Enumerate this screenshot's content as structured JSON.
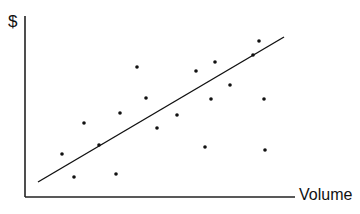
{
  "chart_data": {
    "type": "scatter",
    "title": "",
    "xlabel": "Volume",
    "ylabel": "$",
    "grid": false,
    "legend": null,
    "ticks": {
      "x": [],
      "y": []
    },
    "note": "Coordinates in pixel space of the 360x214 image (x right, y down); axes unlabeled, no numeric scale.",
    "axes": {
      "origin": [
        25,
        197
      ],
      "y_top": [
        25,
        16
      ],
      "x_end": [
        295,
        197
      ]
    },
    "points": [
      {
        "x": 62,
        "y": 154
      },
      {
        "x": 74,
        "y": 177
      },
      {
        "x": 84,
        "y": 123
      },
      {
        "x": 99,
        "y": 145
      },
      {
        "x": 116,
        "y": 174
      },
      {
        "x": 120,
        "y": 113
      },
      {
        "x": 137,
        "y": 67
      },
      {
        "x": 146,
        "y": 98
      },
      {
        "x": 157,
        "y": 128
      },
      {
        "x": 177,
        "y": 115
      },
      {
        "x": 196,
        "y": 71
      },
      {
        "x": 205,
        "y": 147
      },
      {
        "x": 211,
        "y": 99
      },
      {
        "x": 215,
        "y": 62
      },
      {
        "x": 230,
        "y": 85
      },
      {
        "x": 253,
        "y": 55
      },
      {
        "x": 259,
        "y": 41
      },
      {
        "x": 264,
        "y": 99
      },
      {
        "x": 265,
        "y": 150
      }
    ],
    "trend_line": {
      "x1": 38,
      "y1": 182,
      "x2": 284,
      "y2": 37
    }
  },
  "colors": {
    "ink": "#111111",
    "background": "#ffffff"
  }
}
